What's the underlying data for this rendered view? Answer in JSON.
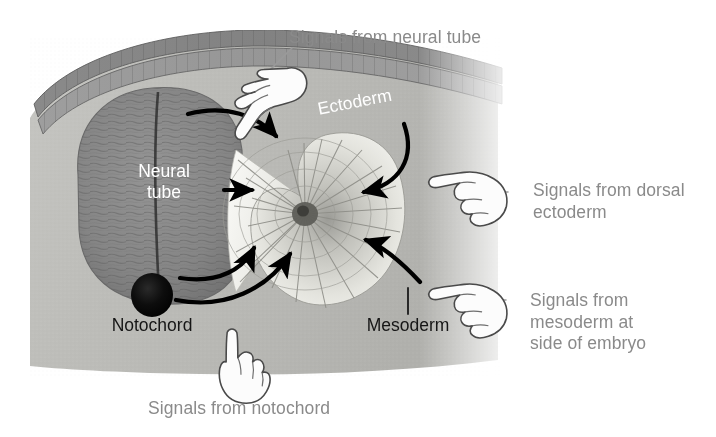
{
  "figure": {
    "kind": "embryology-diagram",
    "title_internal": "Inductive signals converging on the somite",
    "width": 716,
    "height": 437,
    "background_color": "#ffffff"
  },
  "callouts": [
    {
      "id": "neural-tube-signal",
      "text": "Signals from neural tube",
      "color": "#8a8a8a",
      "hand_icon": "hand-pointing-down-icon",
      "position": "top-center"
    },
    {
      "id": "dorsal-ectoderm-signal",
      "text": "Signals from dorsal\nectoderm",
      "color": "#8a8a8a",
      "hand_icon": "hand-pointing-left-icon",
      "position": "right-upper"
    },
    {
      "id": "mesoderm-signal",
      "text": "Signals from\nmesoderm at\nside of embryo",
      "color": "#8a8a8a",
      "hand_icon": "hand-pointing-left-icon",
      "position": "right-lower"
    },
    {
      "id": "notochord-signal",
      "text": "Signals from notochord",
      "color": "#8a8a8a",
      "hand_icon": "hand-pointing-up-icon",
      "position": "bottom-center"
    }
  ],
  "structures": [
    {
      "id": "neural-tube",
      "label": "Neural\ntube",
      "label_color": "#ffffff",
      "fill_color": "#8c8c8c"
    },
    {
      "id": "ectoderm",
      "label": "Ectoderm",
      "label_color": "#ffffff",
      "fill_color": "#989898"
    },
    {
      "id": "notochord",
      "label": "Notochord",
      "label_color": "#161616",
      "fill_color": "#0a0a0a"
    },
    {
      "id": "mesoderm",
      "label": "Mesoderm",
      "label_color": "#161616",
      "fill_color": "#e8e8e4"
    },
    {
      "id": "somite",
      "label": "",
      "label_color": "#161616",
      "fill_color": "#d8d8d2"
    },
    {
      "id": "embryo-block",
      "label": "",
      "label_color": "#161616",
      "fill_color": "#b4b4b0"
    }
  ],
  "arrows": [
    {
      "id": "arrow-neural-tube-to-somite",
      "from": "neural-tube",
      "to": "somite",
      "color": "#000000"
    },
    {
      "id": "arrow-neural-tube-lateral-to-somite",
      "from": "neural-tube",
      "to": "somite",
      "color": "#000000"
    },
    {
      "id": "arrow-dorsal-ectoderm-to-somite",
      "from": "ectoderm",
      "to": "somite",
      "color": "#000000"
    },
    {
      "id": "arrow-notochord-to-somite",
      "from": "notochord",
      "to": "somite",
      "color": "#000000"
    },
    {
      "id": "arrow-ventral-to-somite",
      "from": "neural-tube",
      "to": "somite",
      "color": "#000000"
    },
    {
      "id": "arrow-lateral-mesoderm-to-somite",
      "from": "mesoderm",
      "to": "somite",
      "color": "#000000"
    }
  ],
  "leader_lines": [
    {
      "id": "leader-neural-tube",
      "callout": "neural-tube-signal",
      "color": "#9a9a9a"
    },
    {
      "id": "leader-mesoderm",
      "callout": "mesoderm-label",
      "color": "#1a1a1a"
    },
    {
      "id": "leader-notochord",
      "callout": "notochord-signal",
      "color": "#9a9a9a"
    }
  ],
  "palette": {
    "background": "#ffffff",
    "block_base": "#b4b4b0",
    "block_light": "#c8c8c4",
    "neural_tube": "#8c8c8c",
    "neural_tube_dark": "#6e6e6e",
    "ectoderm_band": "#8e8e8e",
    "ectoderm_band_dark": "#757575",
    "somite_light": "#efefeb",
    "somite_mid": "#c4c4be",
    "somite_dark": "#8f8f8a",
    "notochord": "#0a0a0a",
    "arrow": "#000000",
    "callout_text": "#8a8a8a",
    "dark_text": "#161616",
    "light_text": "#ffffff",
    "hand_outline": "#4a4a4a",
    "hand_fill": "#fbfbfb"
  }
}
